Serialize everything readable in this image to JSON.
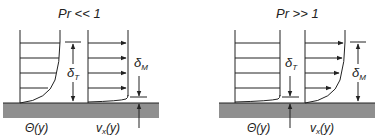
{
  "panels": [
    {
      "id": "low-prandtl",
      "title": "Pr << 1",
      "temperature_label": "Θ(y)",
      "velocity_label": "v",
      "velocity_subscript": "x",
      "velocity_arg": "(y)",
      "thermal_label": "δ",
      "thermal_subscript": "T",
      "momentum_label": "δ",
      "momentum_subscript": "M",
      "description": "Thermal boundary layer thicker than momentum boundary layer"
    },
    {
      "id": "high-prandtl",
      "title": "Pr >> 1",
      "temperature_label": "Θ(y)",
      "velocity_label": "v",
      "velocity_subscript": "x",
      "velocity_arg": "(y)",
      "thermal_label": "δ",
      "thermal_subscript": "T",
      "momentum_label": "δ",
      "momentum_subscript": "M",
      "description": "Momentum boundary layer thicker than thermal boundary layer"
    }
  ],
  "colors": {
    "ink": "#222222",
    "wall": "#8f8f8f",
    "background": "#ffffff"
  }
}
